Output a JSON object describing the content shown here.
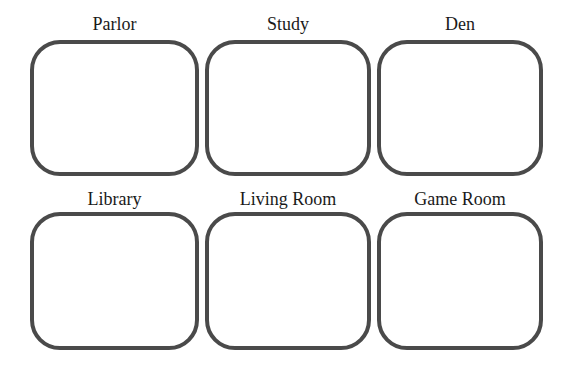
{
  "diagram": {
    "kind": "room-grid",
    "rows": 2,
    "columns": 3
  },
  "rooms": [
    {
      "label": "Parlor"
    },
    {
      "label": "Study"
    },
    {
      "label": "Den"
    },
    {
      "label": "Library"
    },
    {
      "label": "Living Room"
    },
    {
      "label": "Game Room"
    }
  ],
  "colors": {
    "background": "#ffffff",
    "box_border": "#4a4a4a",
    "box_fill": "#ffffff",
    "label_text": "#1a1a1a"
  }
}
